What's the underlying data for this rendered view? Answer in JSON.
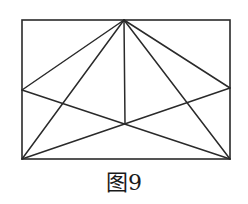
{
  "caption": "图9",
  "colors": {
    "stroke": "#2a2a2a",
    "background": "#ffffff"
  },
  "rectangle": {
    "x": 22,
    "y": 20,
    "width": 208,
    "height": 139
  },
  "points": {
    "apex": [
      124,
      20
    ],
    "left_mid": [
      22,
      90
    ],
    "right_mid": [
      230,
      88
    ],
    "center": [
      125,
      124
    ],
    "bottom_left": [
      22,
      159
    ],
    "bottom_right": [
      230,
      159
    ]
  },
  "segments": [
    [
      "apex",
      "left_mid"
    ],
    [
      "apex",
      "right_mid"
    ],
    [
      "apex",
      "bottom_left"
    ],
    [
      "apex",
      "bottom_right"
    ],
    [
      "apex",
      "center"
    ],
    [
      "left_mid",
      "bottom_right"
    ],
    [
      "right_mid",
      "bottom_left"
    ]
  ]
}
